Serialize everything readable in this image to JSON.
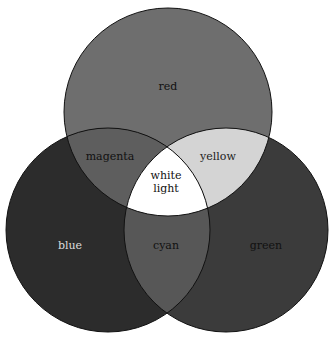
{
  "diagram": {
    "circles": [
      {
        "id": "red",
        "label": "red",
        "color": "#6e6e6e",
        "label_color": "#111111"
      },
      {
        "id": "blue",
        "label": "blue",
        "color": "#2c2c2c",
        "label_color": "#dddddd"
      },
      {
        "id": "green",
        "label": "green",
        "color": "#3b3b3b",
        "label_color": "#111111"
      }
    ],
    "overlaps": [
      {
        "id": "magenta",
        "label": "magenta",
        "color": "#5e5e5e"
      },
      {
        "id": "yellow",
        "label": "yellow",
        "color": "#d4d4d4"
      },
      {
        "id": "cyan",
        "label": "cyan",
        "color": "#575757"
      },
      {
        "id": "white",
        "label_line1": "white",
        "label_line2": "light",
        "color": "#ffffff"
      }
    ]
  }
}
